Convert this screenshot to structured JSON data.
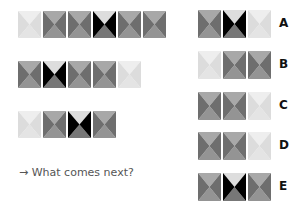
{
  "palette": {
    "light": {
      "top": "#eeeeee",
      "side": "#dcdcdc",
      "bottom": "#e4e4e4"
    },
    "mid": {
      "top": "#a8a8a8",
      "side": "#6e6e6e",
      "bottom": "#949494"
    },
    "dark": {
      "top": "#dddddd",
      "side": "#000000",
      "bottom": "#777777"
    }
  },
  "sequence_rows": [
    [
      "light",
      "mid",
      "mid",
      "dark",
      "mid",
      "mid"
    ],
    [
      "mid",
      "dark",
      "mid",
      "mid",
      "light"
    ],
    [
      "light",
      "mid",
      "dark",
      "mid"
    ]
  ],
  "prompt": "→ What comes next?",
  "options": [
    {
      "label": "A",
      "tiles": [
        "mid",
        "dark",
        "light"
      ]
    },
    {
      "label": "B",
      "tiles": [
        "light",
        "mid",
        "mid"
      ]
    },
    {
      "label": "C",
      "tiles": [
        "mid",
        "mid",
        "light"
      ]
    },
    {
      "label": "D",
      "tiles": [
        "mid",
        "mid",
        "light"
      ]
    },
    {
      "label": "E",
      "tiles": [
        "mid",
        "dark",
        "mid"
      ]
    }
  ]
}
